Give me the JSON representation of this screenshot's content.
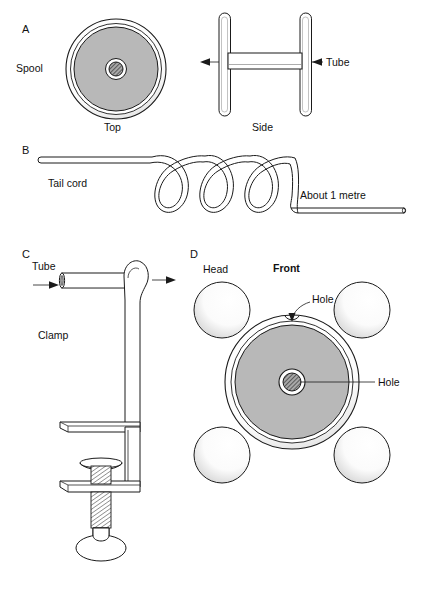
{
  "figure": {
    "background_color": "#ffffff",
    "line_color": "#1a1a1a",
    "disc_fill_color": "#b8b8b8",
    "rim_fill_color": "#ffffff",
    "hub_hatch_color": "#555555"
  },
  "panels": {
    "a": {
      "letter": "A",
      "labels": {
        "spool": "Spool",
        "top": "Top",
        "side": "Side",
        "tube": "Tube"
      }
    },
    "b": {
      "letter": "B",
      "labels": {
        "tail_cord": "Tail cord",
        "length": "About 1 metre"
      },
      "coil_turns": 3
    },
    "c": {
      "letter": "C",
      "labels": {
        "tube": "Tube",
        "clamp": "Clamp"
      }
    },
    "d": {
      "letter": "D",
      "labels": {
        "head": "Head",
        "front": "Front",
        "hole_rim": "Hole",
        "hole_center": "Hole"
      },
      "head_count": 4
    }
  }
}
